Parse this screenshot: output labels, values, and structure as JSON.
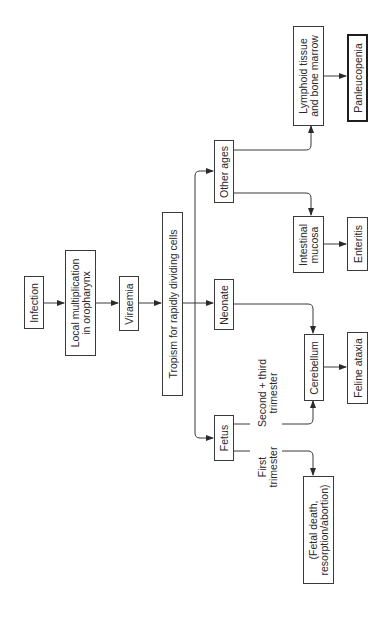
{
  "diagram": {
    "orientation": "rotated-90-ccw",
    "nodes": {
      "infection": {
        "lines": [
          "Infection"
        ]
      },
      "local_multiplication": {
        "lines": [
          "Local multiplication",
          "in oropharynx"
        ]
      },
      "viraemia": {
        "lines": [
          "Viraemia"
        ]
      },
      "tropism": {
        "lines": [
          "Tropism for rapidly dividing cells"
        ]
      },
      "other_ages": {
        "lines": [
          "Other ages"
        ]
      },
      "neonate": {
        "lines": [
          "Neonate"
        ]
      },
      "fetus": {
        "lines": [
          "Fetus"
        ]
      },
      "lymphoid": {
        "lines": [
          "Lymphoid tissue",
          "and bone marrow"
        ]
      },
      "panleucopenia": {
        "lines": [
          "Panleucopenia"
        ]
      },
      "intestinal": {
        "lines": [
          "Intestinal",
          "mucosa"
        ]
      },
      "enteritis": {
        "lines": [
          "Enteritis"
        ]
      },
      "cerebellum": {
        "lines": [
          "Cerebellum"
        ]
      },
      "feline_ataxia": {
        "lines": [
          "Feline ataxia"
        ]
      },
      "fetal_death": {
        "lines": [
          "(Fetal death,",
          "resorption/abortion)"
        ]
      }
    },
    "edge_labels": {
      "second_third": {
        "lines": [
          "Second + third",
          "trimester"
        ]
      },
      "first": {
        "lines": [
          "First",
          "trimester"
        ]
      }
    },
    "edges": [
      [
        "Infection",
        "Local multiplication in oropharynx"
      ],
      [
        "Local multiplication in oropharynx",
        "Viraemia"
      ],
      [
        "Viraemia",
        "Tropism for rapidly dividing cells"
      ],
      [
        "Tropism for rapidly dividing cells",
        "Other ages"
      ],
      [
        "Tropism for rapidly dividing cells",
        "Neonate"
      ],
      [
        "Tropism for rapidly dividing cells",
        "Fetus"
      ],
      [
        "Other ages",
        "Lymphoid tissue and bone marrow"
      ],
      [
        "Other ages",
        "Intestinal mucosa"
      ],
      [
        "Lymphoid tissue and bone marrow",
        "Panleucopenia"
      ],
      [
        "Intestinal mucosa",
        "Enteritis"
      ],
      [
        "Neonate",
        "Cerebellum"
      ],
      [
        "Fetus",
        "Cerebellum",
        "Second + third trimester"
      ],
      [
        "Fetus",
        "(Fetal death, resorption/abortion)",
        "First trimester"
      ],
      [
        "Cerebellum",
        "Feline ataxia"
      ]
    ],
    "colors": {
      "line": "#3a3a3a",
      "text": "#2a2a2a",
      "background": "#ffffff"
    }
  }
}
